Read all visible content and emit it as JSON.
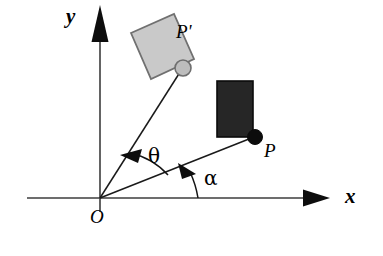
{
  "figure": {
    "background_color": "#ffffff",
    "width": 383,
    "height": 256,
    "axes": {
      "x_label": "x",
      "y_label": "y",
      "origin_label": "O",
      "axis_color": "#3d3d3d",
      "origin": {
        "x": 100,
        "y": 198
      },
      "x_axis": {
        "start_x": 27,
        "end_x": 312,
        "y": 198
      },
      "y_axis": {
        "x": 100,
        "start_y": 10,
        "end_y": 212
      }
    },
    "points": [
      {
        "id": "P",
        "label": "P",
        "marker": "filled-dot",
        "color": "#111111",
        "x": 255,
        "y": 137,
        "radius": 7
      },
      {
        "id": "Pprime",
        "label": "P'",
        "marker": "outlined-dot",
        "color": "#a8a8a8",
        "x": 183,
        "y": 68,
        "radius": 8
      }
    ],
    "bodies": [
      {
        "id": "body-original",
        "label": "dark-rectangle",
        "fill": "#262626",
        "stroke": "#000000",
        "state": "original",
        "x": 217,
        "y": 81,
        "width": 36,
        "height": 56,
        "rotation_deg": 0
      },
      {
        "id": "body-rotated",
        "label": "gray-rectangle",
        "fill": "#c8c8c8",
        "stroke": "#6b6b6b",
        "state": "rotated",
        "corners": "131,33 174,14 194,59 151,79",
        "rotation_deg": -24
      }
    ],
    "segments": [
      {
        "id": "OP",
        "from": "O",
        "to": "P",
        "color": "#1a1a1a"
      },
      {
        "id": "OPprime",
        "from": "O",
        "to": "P'",
        "color": "#1a1a1a"
      }
    ],
    "angles": [
      {
        "id": "theta",
        "label": "θ",
        "meaning": "rotation angle from OP to OP'",
        "from_segment": "OP",
        "to_segment": "OPprime",
        "arrow": "counterclockwise"
      },
      {
        "id": "alpha",
        "label": "α",
        "meaning": "angle of OP from positive x-axis",
        "from_segment": "x-axis",
        "to_segment": "OP",
        "arrow": "counterclockwise"
      }
    ]
  }
}
